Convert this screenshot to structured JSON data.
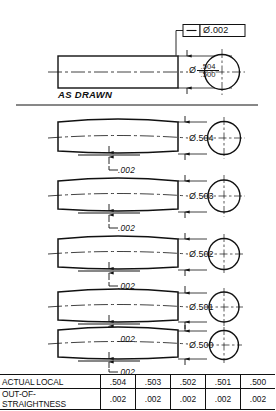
{
  "drawing": {
    "title_label": "AS DRAWN",
    "feature_control_frame": {
      "symbol_name": "straightness-symbol",
      "tolerance": "Ø.002"
    },
    "as_drawn_dimension": {
      "diameter_symbol": "Ø",
      "upper_limit": ".504",
      "lower_limit": ".500"
    },
    "rows": [
      {
        "diameter": "Ø.504",
        "out_of_straightness": ".002"
      },
      {
        "diameter": "Ø.503",
        "out_of_straightness": ".002"
      },
      {
        "diameter": "Ø.502",
        "out_of_straightness": ".002"
      },
      {
        "diameter": "Ø.501",
        "out_of_straightness": ".002"
      },
      {
        "diameter": "Ø.500",
        "out_of_straightness": ".002"
      }
    ]
  },
  "table": {
    "rows": [
      {
        "label": "ACTUAL LOCAL",
        "values": [
          ".504",
          ".503",
          ".502",
          ".501",
          ".500"
        ]
      },
      {
        "label": "OUT-OF-STRAIGHTNESS",
        "values": [
          ".002",
          ".002",
          ".002",
          ".002",
          ".002"
        ]
      }
    ]
  },
  "colors": {
    "line": "#111111",
    "background": "#ffffff"
  }
}
